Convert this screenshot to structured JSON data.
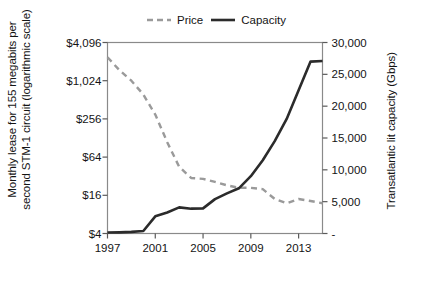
{
  "chart_data": {
    "type": "line",
    "title": "",
    "xlabel": "",
    "ylabel": "Monthly lease for 155 megabits per second STM-1 circuit (logarithmic scale)",
    "y2label": "Transatlantic lit capacity (Gbps)",
    "xlim": [
      1997,
      2015
    ],
    "xticks": [
      1997,
      2001,
      2005,
      2009,
      2013
    ],
    "xtick_labels": [
      "1997",
      "2001",
      "2005",
      "2009",
      "2013"
    ],
    "ylim": [
      4,
      4096
    ],
    "yscale": "log",
    "yticks": [
      4,
      16,
      64,
      256,
      1024,
      4096
    ],
    "ytick_labels": [
      "$4",
      "$16",
      "$64",
      "$256",
      "$1,024",
      "$4,096"
    ],
    "y2lim": [
      0,
      30000
    ],
    "y2ticks": [
      0,
      5000,
      10000,
      15000,
      20000,
      25000,
      30000
    ],
    "y2tick_labels": [
      "-",
      "5,000",
      "10,000",
      "15,000",
      "20,000",
      "25,000",
      "30,000"
    ],
    "grid": false,
    "legend_position": "top-center",
    "series": [
      {
        "name": "Price",
        "axis": "left",
        "style": "dashed",
        "color": "#9a9a9a",
        "x": [
          1997,
          1998,
          1999,
          2000,
          2001,
          2002,
          2003,
          2004,
          2005,
          2006,
          2007,
          2008,
          2009,
          2010,
          2011,
          2012,
          2013,
          2014,
          2015
        ],
        "values": [
          2400,
          1500,
          1024,
          620,
          300,
          110,
          45,
          30,
          29,
          26,
          23,
          21,
          21,
          20,
          14,
          12,
          14,
          13,
          12
        ]
      },
      {
        "name": "Capacity",
        "axis": "right",
        "style": "solid",
        "color": "#2b2b2b",
        "x": [
          1997,
          1998,
          1999,
          2000,
          2001,
          2002,
          2003,
          2004,
          2005,
          2006,
          2007,
          2008,
          2009,
          2010,
          2011,
          2012,
          2013,
          2014,
          2015
        ],
        "values": [
          150,
          180,
          250,
          400,
          2700,
          3300,
          4100,
          3900,
          3950,
          5400,
          6300,
          7100,
          9000,
          11500,
          14500,
          18000,
          22500,
          27000,
          27100
        ]
      }
    ]
  },
  "legend": {
    "items": [
      {
        "label": "Price",
        "style": "dashed",
        "color": "#9a9a9a"
      },
      {
        "label": "Capacity",
        "style": "solid",
        "color": "#2b2b2b"
      }
    ]
  },
  "axes": {
    "left_title": "Monthly lease for 155 megabits per second STM-1 circuit (logarithmic scale)",
    "right_title": "Transatlantic lit capacity (Gbps)"
  }
}
